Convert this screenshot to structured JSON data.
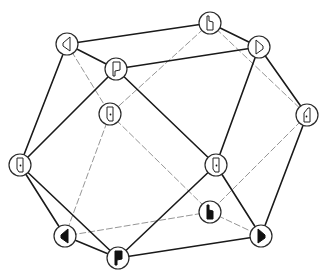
{
  "diagram": {
    "type": "cuboctahedron",
    "line_colors": {
      "visible_edge": "#1a1a1a",
      "hidden_edge": "#8a8a8a",
      "node_stroke": "#2a2a2a"
    },
    "nodes": [
      {
        "id": "V1",
        "x": 67,
        "y": 44,
        "glyph": "triangle-left-hatched"
      },
      {
        "id": "V2",
        "x": 210,
        "y": 23,
        "glyph": "notched-bar-hatched"
      },
      {
        "id": "V3",
        "x": 116,
        "y": 69,
        "glyph": "flag-hatched"
      },
      {
        "id": "V4",
        "x": 259,
        "y": 47,
        "glyph": "triangle-right-hatched"
      },
      {
        "id": "V5",
        "x": 110,
        "y": 114,
        "glyph": "door-dotted"
      },
      {
        "id": "V6",
        "x": 307,
        "y": 115,
        "glyph": "door-dotted-mirrored"
      },
      {
        "id": "V7",
        "x": 20,
        "y": 165,
        "glyph": "door-dotted"
      },
      {
        "id": "V8",
        "x": 216,
        "y": 165,
        "glyph": "door-dotted"
      },
      {
        "id": "V9",
        "x": 210,
        "y": 212,
        "glyph": "notched-bar-black"
      },
      {
        "id": "V10",
        "x": 65,
        "y": 236,
        "glyph": "triangle-left-black"
      },
      {
        "id": "V11",
        "x": 261,
        "y": 236,
        "glyph": "triangle-right-black"
      },
      {
        "id": "V12",
        "x": 118,
        "y": 258,
        "glyph": "flag-black"
      }
    ],
    "visible_edges": [
      [
        "V1",
        "V2"
      ],
      [
        "V1",
        "V3"
      ],
      [
        "V1",
        "V7"
      ],
      [
        "V3",
        "V4"
      ],
      [
        "V3",
        "V7"
      ],
      [
        "V3",
        "V8"
      ],
      [
        "V2",
        "V4"
      ],
      [
        "V4",
        "V8"
      ],
      [
        "V4",
        "V6"
      ],
      [
        "V6",
        "V11"
      ],
      [
        "V8",
        "V11"
      ],
      [
        "V8",
        "V12"
      ],
      [
        "V7",
        "V10"
      ],
      [
        "V7",
        "V12"
      ],
      [
        "V10",
        "V12"
      ],
      [
        "V12",
        "V11"
      ]
    ],
    "hidden_edges": [
      [
        "V1",
        "V5"
      ],
      [
        "V2",
        "V5"
      ],
      [
        "V2",
        "V6"
      ],
      [
        "V5",
        "V10"
      ],
      [
        "V5",
        "V9"
      ],
      [
        "V6",
        "V9"
      ],
      [
        "V9",
        "V10"
      ],
      [
        "V9",
        "V11"
      ]
    ],
    "node_radius": 11
  }
}
